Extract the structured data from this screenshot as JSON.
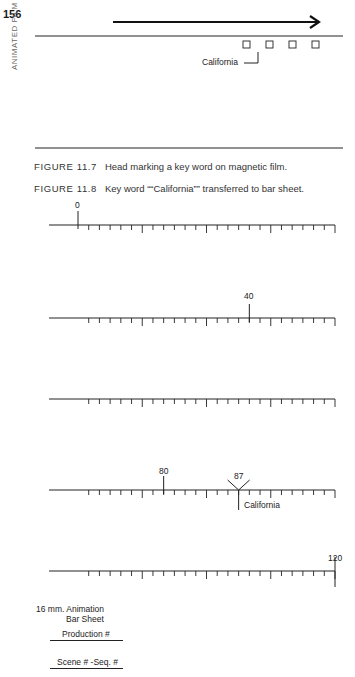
{
  "page": {
    "number": "156",
    "running_head": "ANIMATED FILM"
  },
  "figure_11_7": {
    "caption_number": "FIGURE 11.7",
    "caption_text": "Head marking a key word on magnetic film.",
    "key_word_label": "California",
    "sprocket_count": 4
  },
  "figure_11_8": {
    "caption_number": "FIGURE 11.8",
    "caption_text": "Key word ““California”” transferred to bar sheet.",
    "frames_per_row": 24,
    "rows": [
      {
        "start": 0,
        "end": 24,
        "labels": [
          {
            "frame": 0,
            "text": "0"
          }
        ]
      },
      {
        "start": 24,
        "end": 48,
        "labels": [
          {
            "frame": 40,
            "text": "40"
          }
        ]
      },
      {
        "start": 48,
        "end": 72,
        "labels": []
      },
      {
        "start": 72,
        "end": 96,
        "labels": [
          {
            "frame": 80,
            "text": "80"
          },
          {
            "frame": 87,
            "text": "87",
            "marker": "California"
          }
        ]
      },
      {
        "start": 96,
        "end": 120,
        "labels": [
          {
            "frame": 120,
            "text": "120"
          }
        ]
      }
    ],
    "marker_label": "California",
    "sheet_title_line1": "16 mm. Animation",
    "sheet_title_line2": "Bar Sheet",
    "production_label": "Production #",
    "scene_label": "Scene # -Seq. #"
  },
  "labels": {
    "row1_0": "0",
    "row2_40": "40",
    "row4_80": "80",
    "row4_87": "87",
    "row5_120": "120"
  }
}
